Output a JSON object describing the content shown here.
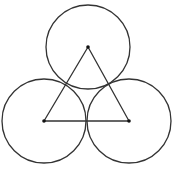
{
  "diagram": {
    "stroke_color": "#333333",
    "point_color": "#111111",
    "circles": [
      {
        "name": "top",
        "cx": 88,
        "cy": 47,
        "r": 42
      },
      {
        "name": "left",
        "cx": 44,
        "cy": 121,
        "r": 42
      },
      {
        "name": "right",
        "cx": 129,
        "cy": 121,
        "r": 42
      }
    ],
    "triangle": {
      "vertices": [
        [
          88,
          47
        ],
        [
          44,
          121
        ],
        [
          129,
          121
        ]
      ]
    },
    "caption": ""
  }
}
